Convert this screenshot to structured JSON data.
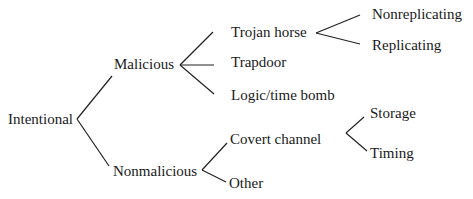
{
  "diagram": {
    "type": "tree",
    "nodes": {
      "intentional": "Intentional",
      "malicious": "Malicious",
      "nonmalicious": "Nonmalicious",
      "trojan_horse": "Trojan horse",
      "trapdoor": "Trapdoor",
      "logic_time_bomb": "Logic/time bomb",
      "nonreplicating": "Nonreplicating",
      "replicating": "Replicating",
      "covert_channel": "Covert channel",
      "other": "Other",
      "storage": "Storage",
      "timing": "Timing"
    },
    "edges": [
      [
        "Intentional",
        "Malicious"
      ],
      [
        "Intentional",
        "Nonmalicious"
      ],
      [
        "Malicious",
        "Trojan horse"
      ],
      [
        "Malicious",
        "Trapdoor"
      ],
      [
        "Malicious",
        "Logic/time bomb"
      ],
      [
        "Trojan horse",
        "Nonreplicating"
      ],
      [
        "Trojan horse",
        "Replicating"
      ],
      [
        "Nonmalicious",
        "Covert channel"
      ],
      [
        "Nonmalicious",
        "Other"
      ],
      [
        "Covert channel",
        "Storage"
      ],
      [
        "Covert channel",
        "Timing"
      ]
    ]
  }
}
